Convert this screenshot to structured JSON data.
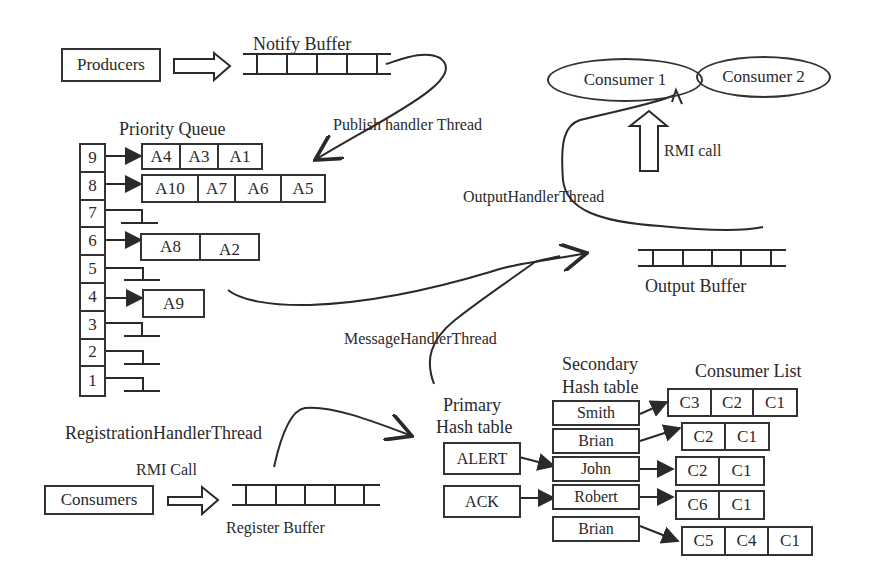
{
  "producers": {
    "label": "Producers"
  },
  "notify_buffer": {
    "title": "Notify Buffer"
  },
  "publish_thread": {
    "label": "Publish handler Thread"
  },
  "priority_queue": {
    "title": "Priority Queue",
    "levels": [
      "9",
      "8",
      "7",
      "6",
      "5",
      "4",
      "3",
      "2",
      "1"
    ],
    "rows": [
      {
        "level": "9",
        "items": [
          "A4",
          "A3",
          "A1"
        ]
      },
      {
        "level": "8",
        "items": [
          "A10",
          "A7",
          "A6",
          "A5"
        ]
      },
      {
        "level": "6",
        "items": [
          "A8",
          "A2"
        ]
      },
      {
        "level": "4",
        "items": [
          "A9"
        ]
      }
    ]
  },
  "consumers_top": {
    "consumer1": "Consumer 1",
    "consumer2": "Consumer 2"
  },
  "rmi_call_top": {
    "label": "RMI call"
  },
  "output_thread": {
    "label": "OutputHandlerThread"
  },
  "output_buffer": {
    "title": "Output Buffer"
  },
  "message_thread": {
    "label": "MessageHandlerThread"
  },
  "registration_thread": {
    "label": "RegistrationHandlerThread"
  },
  "consumers_bottom": {
    "label": "Consumers"
  },
  "rmi_call_bottom": {
    "label": "RMI Call"
  },
  "register_buffer": {
    "title": "Register Buffer"
  },
  "primary_hash": {
    "title_line1": "Primary",
    "title_line2": "Hash table",
    "entries": [
      "ALERT",
      "ACK"
    ]
  },
  "secondary_hash": {
    "title_line1": "Secondary",
    "title_line2": "Hash table",
    "entries": [
      "Smith",
      "Brian",
      "John",
      "Robert",
      "Brian"
    ]
  },
  "consumer_list": {
    "title": "Consumer List",
    "lists": [
      [
        "C3",
        "C2",
        "C1"
      ],
      [
        "C2",
        "C1"
      ],
      [
        "C2",
        "C1"
      ],
      [
        "C6",
        "C1"
      ],
      [
        "C5",
        "C4",
        "C1"
      ]
    ]
  }
}
